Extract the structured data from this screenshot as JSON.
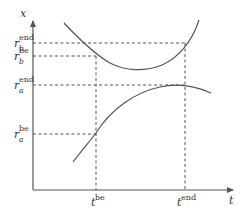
{
  "axes": {
    "y_label": "x",
    "x_label": "t"
  },
  "y_ticks": [
    {
      "base": "r",
      "sub": "b",
      "sup": "end"
    },
    {
      "base": "r",
      "sub": "b",
      "sup": "be"
    },
    {
      "base": "r",
      "sub": "a",
      "sup": "end"
    },
    {
      "base": "r",
      "sub": "a",
      "sup": "be"
    }
  ],
  "x_ticks": [
    {
      "base": "t",
      "sup": "be"
    },
    {
      "base": "t",
      "sup": "end"
    }
  ],
  "curves": [
    {
      "name": "upper-curve-b",
      "shape": "convex U, minimum between t_be and t_end"
    },
    {
      "name": "lower-curve-a",
      "shape": "concave rising then flattening, maximum near t_end"
    }
  ],
  "colors": {
    "line": "#555555",
    "text": "#333333"
  }
}
